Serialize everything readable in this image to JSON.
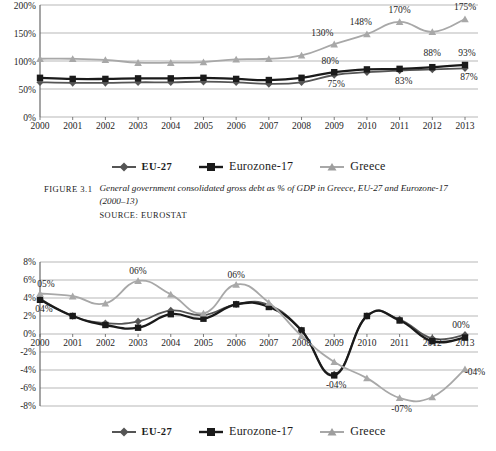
{
  "figure1": {
    "caption_tag": "FIGURE 3.1",
    "caption_text": "General government consolidated gross debt as % of GDP in Greece, EU-27 and Eurozone-17 (2000–13)",
    "source": "SOURCE: EUROSTAT",
    "legend": [
      {
        "name": "EU-27",
        "color": "#555555",
        "marker": "diamond"
      },
      {
        "name": "Eurozone-17",
        "color": "#1a1a1a",
        "marker": "square"
      },
      {
        "name": "Greece",
        "color": "#a8a8a8",
        "marker": "triangle"
      }
    ],
    "chart_data": {
      "type": "line",
      "title": "",
      "xlabel": "",
      "ylabel": "",
      "ylim": [
        0,
        200
      ],
      "yticks": [
        "0%",
        "50%",
        "100%",
        "150%",
        "200%"
      ],
      "grid": true,
      "legend_position": "bottom",
      "categories": [
        "2000",
        "2001",
        "2002",
        "2003",
        "2004",
        "2005",
        "2006",
        "2007",
        "2008",
        "2009",
        "2010",
        "2011",
        "2012",
        "2013"
      ],
      "series": [
        {
          "name": "EU-27",
          "color": "#555555",
          "marker": "diamond",
          "values": [
            62,
            61,
            61,
            62,
            62,
            63,
            62,
            59,
            62,
            75,
            80,
            83,
            85,
            87
          ]
        },
        {
          "name": "Eurozone-17",
          "color": "#1a1a1a",
          "marker": "square",
          "values": [
            70,
            68,
            68,
            69,
            69,
            70,
            68,
            66,
            70,
            80,
            85,
            86,
            89,
            93
          ]
        },
        {
          "name": "Greece",
          "color": "#a8a8a8",
          "marker": "triangle",
          "values": [
            104,
            104,
            102,
            97,
            97,
            98,
            103,
            104,
            110,
            130,
            148,
            170,
            152,
            175
          ]
        }
      ],
      "point_labels": [
        {
          "series": "Eurozone-17",
          "category": "2009",
          "text": "80%"
        },
        {
          "series": "EU-27",
          "category": "2009",
          "text": "75%"
        },
        {
          "series": "Eurozone-17",
          "category": "2012",
          "text": "88%"
        },
        {
          "series": "EU-27",
          "category": "2011",
          "text": "83%"
        },
        {
          "series": "Eurozone-17",
          "category": "2013",
          "text": "93%"
        },
        {
          "series": "EU-27",
          "category": "2013",
          "text": "87%"
        },
        {
          "series": "Greece",
          "category": "2009",
          "text": "130%"
        },
        {
          "series": "Greece",
          "category": "2010",
          "text": "148%"
        },
        {
          "series": "Greece",
          "category": "2011",
          "text": "170%"
        },
        {
          "series": "Greece",
          "category": "2013",
          "text": "175%"
        }
      ]
    }
  },
  "figure2": {
    "legend": [
      {
        "name": "EU-27",
        "color": "#555555",
        "marker": "diamond"
      },
      {
        "name": "Eurozone-17",
        "color": "#1a1a1a",
        "marker": "square"
      },
      {
        "name": "Greece",
        "color": "#a8a8a8",
        "marker": "triangle"
      }
    ],
    "chart_data": {
      "type": "line",
      "title": "",
      "xlabel": "",
      "ylabel": "",
      "ylim": [
        -8,
        8
      ],
      "yticks": [
        "-8%",
        "-6%",
        "-4%",
        "-2%",
        "0%",
        "2%",
        "4%",
        "6%",
        "8%"
      ],
      "grid": true,
      "legend_position": "bottom",
      "categories": [
        "2000",
        "2001",
        "2002",
        "2003",
        "2004",
        "2005",
        "2006",
        "2007",
        "2008",
        "2009",
        "2010",
        "2011",
        "2012",
        "2013"
      ],
      "series": [
        {
          "name": "EU-27",
          "color": "#555555",
          "marker": "diamond",
          "values": [
            3.9,
            2.0,
            1.2,
            1.4,
            2.6,
            2.1,
            3.3,
            3.2,
            0.4,
            -4.5,
            2.0,
            1.6,
            -0.5,
            -0.1
          ]
        },
        {
          "name": "Eurozone-17",
          "color": "#1a1a1a",
          "marker": "square",
          "values": [
            3.8,
            2.0,
            1.0,
            0.7,
            2.2,
            1.7,
            3.3,
            3.0,
            0.4,
            -4.6,
            2.0,
            1.5,
            -0.8,
            -0.4
          ]
        },
        {
          "name": "Greece",
          "color": "#a8a8a8",
          "marker": "triangle",
          "values": [
            4.5,
            4.2,
            3.4,
            5.9,
            4.4,
            2.3,
            5.5,
            3.5,
            -0.2,
            -3.1,
            -4.9,
            -7.1,
            -7.0,
            -3.9
          ]
        }
      ],
      "point_labels": [
        {
          "series": "Greece",
          "category": "2000",
          "text": "05%"
        },
        {
          "series": "EU-27",
          "category": "2000",
          "text": "04%"
        },
        {
          "series": "Greece",
          "category": "2003",
          "text": "06%"
        },
        {
          "series": "Greece",
          "category": "2006",
          "text": "06%"
        },
        {
          "series": "Eurozone-17",
          "category": "2009",
          "text": "-04%"
        },
        {
          "series": "Greece",
          "category": "2011",
          "text": "-07%"
        },
        {
          "series": "Eurozone-17",
          "category": "2013",
          "text": "00%"
        },
        {
          "series": "Greece",
          "category": "2013",
          "text": "-04%"
        }
      ]
    }
  }
}
